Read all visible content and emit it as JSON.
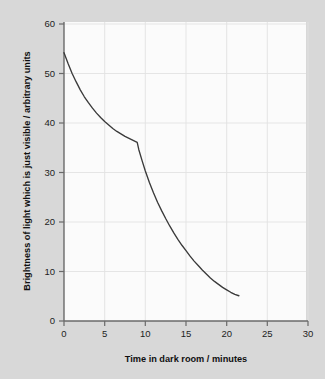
{
  "figure": {
    "background_color": "#d8d8d8",
    "panel_color": "#fbfbfb",
    "curve_color": "#3a3a3a",
    "axis_color": "#6a6a6a",
    "grid_color": "#e2e2e2"
  },
  "chart_data": {
    "type": "line",
    "title": "",
    "xlabel": "Time in dark room / minutes",
    "ylabel": "Brightness of light which is just visible / arbitrary units",
    "xlim": [
      0,
      30
    ],
    "ylim": [
      0,
      60
    ],
    "xticks": [
      0,
      5,
      10,
      15,
      20,
      25,
      30
    ],
    "yticks": [
      0,
      10,
      20,
      30,
      40,
      50,
      60
    ],
    "xtick_labels": [
      "0",
      "5",
      "10",
      "15",
      "20",
      "25",
      "30"
    ],
    "ytick_labels": [
      "0",
      "10",
      "20",
      "30",
      "40",
      "50",
      "60"
    ],
    "grid": true,
    "legend": null,
    "series": [
      {
        "name": "Dark adaptation curve",
        "x": [
          0,
          0.5,
          1,
          1.5,
          2,
          2.5,
          3,
          3.5,
          4,
          4.5,
          5,
          5.5,
          6,
          6.5,
          7,
          7.5,
          8,
          8.5,
          9,
          9.2,
          9.6,
          10,
          10.5,
          11,
          11.5,
          12,
          12.5,
          13,
          13.5,
          14,
          14.5,
          15,
          15.5,
          16,
          16.5,
          17,
          17.5,
          18,
          18.5,
          19,
          19.5,
          20,
          20.5,
          21,
          21.5
        ],
        "y": [
          54.2,
          52.0,
          50.0,
          48.3,
          46.7,
          45.3,
          44.1,
          43.0,
          42.0,
          41.1,
          40.3,
          39.6,
          38.9,
          38.3,
          37.8,
          37.3,
          36.9,
          36.5,
          36.1,
          34.6,
          32.4,
          30.3,
          28.0,
          25.9,
          24.0,
          22.3,
          20.7,
          19.2,
          17.8,
          16.5,
          15.3,
          14.2,
          13.1,
          12.1,
          11.2,
          10.3,
          9.5,
          8.7,
          8.0,
          7.4,
          6.8,
          6.3,
          5.8,
          5.4,
          5.1
        ]
      }
    ],
    "annotations": [
      {
        "name": "rod-cone-break",
        "x": 9,
        "y": 36.1,
        "description": "Sharp discontinuity in gradient"
      }
    ]
  }
}
